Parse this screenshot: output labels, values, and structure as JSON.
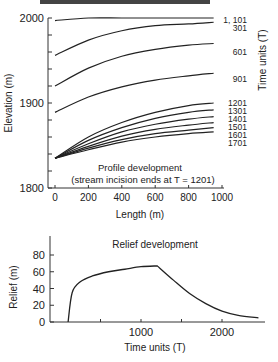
{
  "header": {
    "partial_title": "MODELLING EROSION ..."
  },
  "chart_data": [
    {
      "type": "line",
      "title": "Profile development",
      "subtitle": "(stream incision ends at T = 1201)",
      "xlabel": "Length (m)",
      "ylabel": "Elevation (m)",
      "legend_title": "Time units (T)",
      "xlim": [
        0,
        1000
      ],
      "ylim": [
        1800,
        2000
      ],
      "xticks": [
        "0",
        "200",
        "400",
        "600",
        "800",
        "1000"
      ],
      "yticks": [
        "1800",
        "1900",
        "2000"
      ],
      "x": [
        0,
        200,
        400,
        600,
        800,
        950
      ],
      "series": [
        {
          "name": "1, 101",
          "values": [
            1997,
            2000,
            2000,
            2000,
            2000,
            2000
          ]
        },
        {
          "name": "301",
          "values": [
            1956,
            1974,
            1985,
            1991,
            1993,
            1995
          ]
        },
        {
          "name": "601",
          "values": [
            1920,
            1941,
            1955,
            1963,
            1968,
            1970
          ]
        },
        {
          "name": "901",
          "values": [
            1889,
            1907,
            1919,
            1927,
            1932,
            1935
          ]
        },
        {
          "name": "1201",
          "values": [
            1835,
            1860,
            1877,
            1889,
            1897,
            1900
          ]
        },
        {
          "name": "1301",
          "values": [
            1835,
            1856,
            1871,
            1882,
            1889,
            1892
          ]
        },
        {
          "name": "1401",
          "values": [
            1835,
            1852,
            1866,
            1875,
            1881,
            1884
          ]
        },
        {
          "name": "1501",
          "values": [
            1835,
            1849,
            1861,
            1869,
            1874,
            1877
          ]
        },
        {
          "name": "1601",
          "values": [
            1835,
            1847,
            1857,
            1864,
            1868,
            1871
          ]
        },
        {
          "name": "1701",
          "values": [
            1835,
            1845,
            1854,
            1860,
            1864,
            1866
          ]
        }
      ]
    },
    {
      "type": "line",
      "title": "Relief development",
      "xlabel": "Time units (T)",
      "ylabel": "Relief (m)",
      "xlim": [
        0,
        2500
      ],
      "ylim": [
        0,
        90
      ],
      "xticks": [
        "1000",
        "2000"
      ],
      "yticks": [
        "0",
        "20",
        "40",
        "60",
        "80"
      ],
      "x": [
        100,
        150,
        250,
        400,
        600,
        800,
        1000,
        1201,
        1400,
        1600,
        1800,
        2000,
        2200,
        2450
      ],
      "series": [
        {
          "name": "Relief",
          "values": [
            0,
            35,
            48,
            55,
            60,
            63,
            66,
            67,
            50,
            34,
            22,
            13,
            8,
            5
          ]
        }
      ]
    }
  ]
}
